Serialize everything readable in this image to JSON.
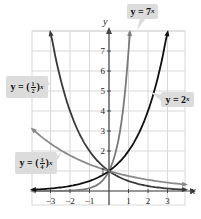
{
  "chart_data": {
    "type": "line",
    "title": "",
    "xlabel": "x",
    "ylabel": "y",
    "xlim": [
      -3.9,
      3.9
    ],
    "ylim": [
      -0.7,
      8.0
    ],
    "x_ticks": [
      -3,
      -2,
      -1,
      1,
      2,
      3
    ],
    "x_tick_labels": [
      "−3",
      "−2",
      "−1",
      "1",
      "2",
      "3"
    ],
    "y_ticks": [
      1,
      2,
      3,
      4,
      5,
      6,
      7
    ],
    "y_tick_labels": [
      "1",
      "2",
      "3",
      "4",
      "5",
      "6",
      "7"
    ],
    "grid": true,
    "series": [
      {
        "name": "y = 7^x",
        "base": 7,
        "color": "#7a7a7a",
        "x_range": [
          -3.9,
          1.07
        ]
      },
      {
        "name": "y = 2^x",
        "base": 2,
        "color": "#111111",
        "x_range": [
          -3.9,
          3.0
        ]
      },
      {
        "name": "y = (1/2)^x",
        "base": 0.5,
        "color": "#3a3a3a",
        "x_range": [
          -3.0,
          3.9
        ]
      },
      {
        "name": "y = (3/4)^x",
        "base": 0.75,
        "color": "#8a8a8a",
        "x_range": [
          -3.9,
          3.9
        ]
      }
    ],
    "annotations": [
      {
        "text": "y = 7^x",
        "points_to": "7^x curve near top"
      },
      {
        "text": "y = 2^x",
        "points_to": "2^x curve right side"
      },
      {
        "text": "y = (1/2)^x",
        "points_to": "(1/2)^x curve upper-left"
      },
      {
        "text": "y = (3/4)^x",
        "points_to": "(3/4)^x curve left"
      }
    ]
  },
  "labels": {
    "seven": {
      "base": "y = 7",
      "exp": "x"
    },
    "two": {
      "base": "y = 2",
      "exp": "x"
    },
    "half": {
      "prefix": "y = (",
      "num": "1",
      "den": "2",
      "suffix": ")",
      "exp": "x"
    },
    "threequarter": {
      "prefix": "y = (",
      "num": "3",
      "den": "4",
      "suffix": ")",
      "exp": "x"
    }
  },
  "colors": {
    "grid": "#d8d8d8",
    "axis": "#444444",
    "label_bg": "#dcdcdc"
  }
}
